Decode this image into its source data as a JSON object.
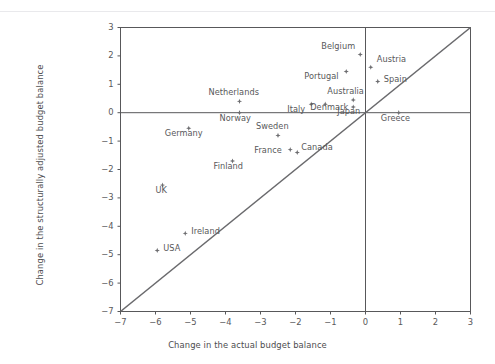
{
  "chart_data": {
    "type": "scatter",
    "title": "",
    "xlabel": "Change in the actual budget balance",
    "ylabel": "Change in the structurally adjusted budget balance",
    "xlim": [
      -7,
      3
    ],
    "ylim": [
      -7,
      3
    ],
    "xticks": [
      -7,
      -6,
      -5,
      -4,
      -3,
      -2,
      -1,
      0,
      1,
      2,
      3
    ],
    "xtick_labels": [
      "−7",
      "−6",
      "−5",
      "−4",
      "−3",
      "−2",
      "−1",
      "0",
      "1",
      "2",
      "3"
    ],
    "yticks": [
      3,
      2,
      1,
      0,
      -1,
      -2,
      -3,
      -4,
      -5,
      -6,
      -7
    ],
    "ytick_labels": [
      "3",
      "2",
      "1",
      "0",
      "−1",
      "−2",
      "−3",
      "−4",
      "−5",
      "−6",
      "−7"
    ],
    "grid": false,
    "legend": null,
    "reference_lines": [
      {
        "name": "y-zero-line",
        "type": "horizontal",
        "value": 0
      },
      {
        "name": "x-zero-line",
        "type": "vertical",
        "value": 0
      },
      {
        "name": "identity-line",
        "type": "diagonal",
        "from": [
          -7,
          -7
        ],
        "to": [
          3,
          3
        ]
      }
    ],
    "marker_color": "#6d6d70",
    "axis_color": "#58585a",
    "points": [
      {
        "name": "Belgium",
        "x": -0.15,
        "y": 2.05,
        "label_dx": -39,
        "label_dy": -9
      },
      {
        "name": "Austria",
        "x": 0.15,
        "y": 1.6,
        "label_dx": 6,
        "label_dy": -9
      },
      {
        "name": "Portugal",
        "x": -0.55,
        "y": 1.45,
        "label_dx": -42,
        "label_dy": 3
      },
      {
        "name": "Spain",
        "x": 0.35,
        "y": 1.1,
        "label_dx": 6,
        "label_dy": -3
      },
      {
        "name": "Australia",
        "x": -0.35,
        "y": 0.45,
        "label_dx": -26,
        "label_dy": -10
      },
      {
        "name": "Denmark",
        "x": -1.15,
        "y": 0.3,
        "label_dx": -15,
        "label_dy": 2
      },
      {
        "name": "Japan",
        "x": -0.35,
        "y": 0.2,
        "label_dx": -16,
        "label_dy": 3
      },
      {
        "name": "Italy",
        "x": -1.55,
        "y": 0.3,
        "label_dx": -24,
        "label_dy": 4
      },
      {
        "name": "Netherlands",
        "x": -3.6,
        "y": 0.4,
        "label_dx": -31,
        "label_dy": -10
      },
      {
        "name": "Norway",
        "x": -3.6,
        "y": 0.0,
        "label_dx": -20,
        "label_dy": 4
      },
      {
        "name": "Greece",
        "x": 0.95,
        "y": 0.0,
        "label_dx": -18,
        "label_dy": 4
      },
      {
        "name": "Germany",
        "x": -5.05,
        "y": -0.55,
        "label_dx": -24,
        "label_dy": 4
      },
      {
        "name": "Sweden",
        "x": -2.5,
        "y": -0.8,
        "label_dx": -22,
        "label_dy": -10
      },
      {
        "name": "France",
        "x": -2.15,
        "y": -1.3,
        "label_dx": -36,
        "label_dy": -1
      },
      {
        "name": "Canada",
        "x": -1.95,
        "y": -1.4,
        "label_dx": 4,
        "label_dy": -6
      },
      {
        "name": "Finland",
        "x": -3.8,
        "y": -1.7,
        "label_dx": -19,
        "label_dy": 4
      },
      {
        "name": "UK",
        "x": -5.8,
        "y": -2.55,
        "label_dx": -7,
        "label_dy": 4
      },
      {
        "name": "Ireland",
        "x": -5.15,
        "y": -4.25,
        "label_dx": 6,
        "label_dy": -3
      },
      {
        "name": "USA",
        "x": -5.95,
        "y": -4.85,
        "label_dx": 6,
        "label_dy": -3
      }
    ]
  }
}
